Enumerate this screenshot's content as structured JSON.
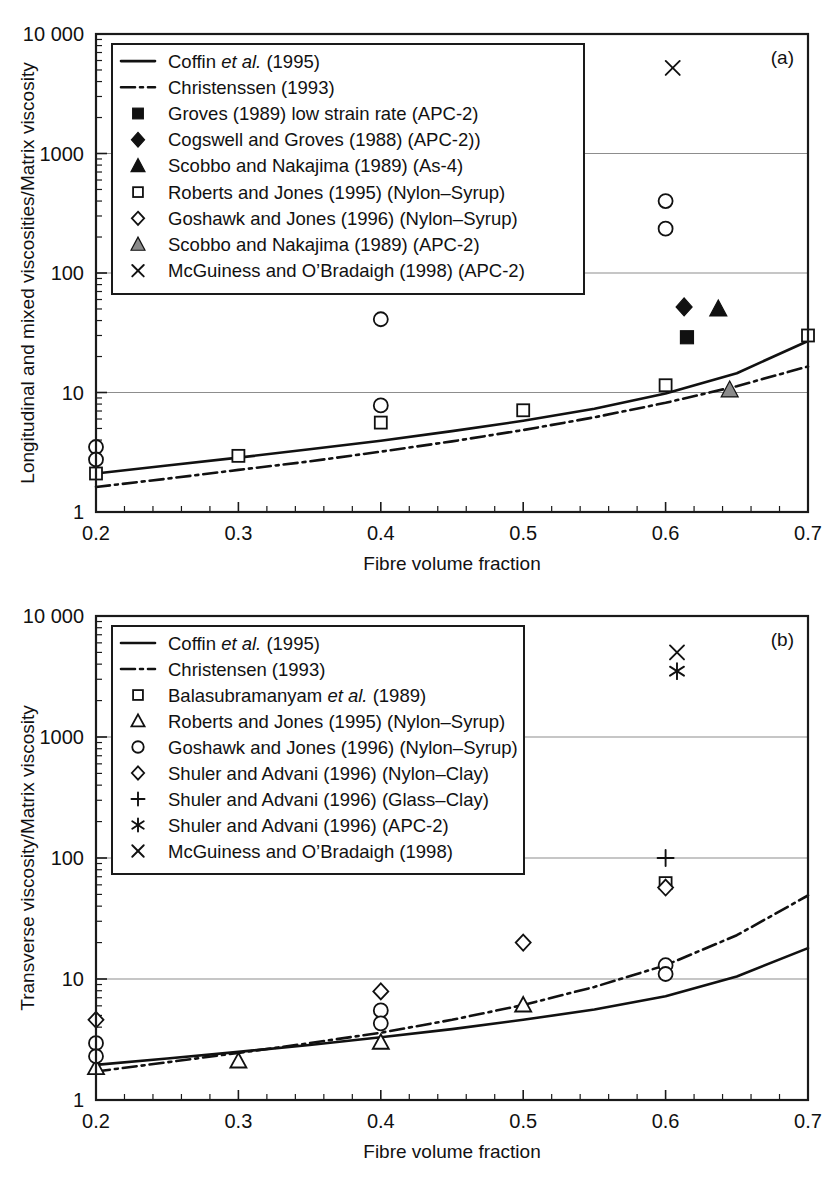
{
  "figure": {
    "panels": [
      "a",
      "b"
    ]
  },
  "panel_a": {
    "label": "(a)",
    "ylabel": "Longitudinal and mixed viscosities/Matrix viscosity",
    "xlabel": "Fibre volume fraction",
    "ytick_labels": [
      "1",
      "10",
      "100",
      "1000",
      "10 000"
    ],
    "xtick_labels": [
      "0.2",
      "0.3",
      "0.4",
      "0.5",
      "0.6",
      "0.7"
    ],
    "legend": [
      {
        "marker": "line-solid",
        "label": "Coffin ",
        "italic": "et al.",
        "tail": " (1995)"
      },
      {
        "marker": "line-dashdot",
        "label": "Christenssen (1993)",
        "italic": "",
        "tail": ""
      },
      {
        "marker": "square-filled",
        "label": "Groves (1989) low strain rate (APC-2)",
        "italic": "",
        "tail": ""
      },
      {
        "marker": "diamond-filled",
        "label": "Cogswell and Groves (1988) (APC-2))",
        "italic": "",
        "tail": ""
      },
      {
        "marker": "triangle-filled",
        "label": "Scobbo and Nakajima (1989) (As-4)",
        "italic": "",
        "tail": ""
      },
      {
        "marker": "square-open",
        "label": "Roberts and Jones (1995) (Nylon–Syrup)",
        "italic": "",
        "tail": ""
      },
      {
        "marker": "diamond-open",
        "label": "Goshawk and Jones (1996) (Nylon–Syrup)",
        "italic": "",
        "tail": ""
      },
      {
        "marker": "triangle-gray",
        "label": "Scobbo and Nakajima (1989) (APC-2)",
        "italic": "",
        "tail": ""
      },
      {
        "marker": "cross-x",
        "label": "McGuiness and O’Bradaigh (1998) (APC-2)",
        "italic": "",
        "tail": ""
      }
    ]
  },
  "panel_b": {
    "label": "(b)",
    "ylabel": "Transverse viscosity/Matrix viscosity",
    "xlabel": "Fibre volume fraction",
    "ytick_labels": [
      "1",
      "10",
      "100",
      "1000",
      "10 000"
    ],
    "xtick_labels": [
      "0.2",
      "0.3",
      "0.4",
      "0.5",
      "0.6",
      "0.7"
    ],
    "legend": [
      {
        "marker": "line-solid",
        "label": "Coffin ",
        "italic": "et al.",
        "tail": " (1995)"
      },
      {
        "marker": "line-dashdot",
        "label": "Christensen (1993)",
        "italic": "",
        "tail": ""
      },
      {
        "marker": "square-open",
        "label": "Balasubramanyam ",
        "italic": "et al.",
        "tail": " (1989)"
      },
      {
        "marker": "triangle-open",
        "label": "Roberts and Jones (1995) (Nylon–Syrup)",
        "italic": "",
        "tail": ""
      },
      {
        "marker": "circle-open",
        "label": "Goshawk and Jones (1996) (Nylon–Syrup)",
        "italic": "",
        "tail": ""
      },
      {
        "marker": "diamond-open",
        "label": "Shuler and Advani (1996) (Nylon–Clay)",
        "italic": "",
        "tail": ""
      },
      {
        "marker": "plus",
        "label": "Shuler and Advani (1996) (Glass–Clay)",
        "italic": "",
        "tail": ""
      },
      {
        "marker": "asterisk",
        "label": "Shuler and Advani (1996) (APC-2)",
        "italic": "",
        "tail": ""
      },
      {
        "marker": "cross-x",
        "label": "McGuiness and O’Bradaigh (1998)",
        "italic": "",
        "tail": ""
      }
    ]
  },
  "chart_data": [
    {
      "type": "scatter",
      "panel": "a",
      "title": "",
      "xlabel": "Fibre volume fraction",
      "ylabel": "Longitudinal and mixed viscosities/Matrix viscosity",
      "xlim": [
        0.2,
        0.7
      ],
      "ylim": [
        1,
        10000
      ],
      "yscale": "log",
      "xticks": [
        0.2,
        0.3,
        0.4,
        0.5,
        0.6,
        0.7
      ],
      "yticks": [
        1,
        10,
        100,
        1000,
        10000
      ],
      "grid": "horizontal-major",
      "legend_position": "upper-left",
      "series": [
        {
          "name": "Coffin et al. (1995)",
          "type": "line",
          "style": "solid",
          "x": [
            0.2,
            0.25,
            0.3,
            0.35,
            0.4,
            0.45,
            0.5,
            0.55,
            0.6,
            0.65,
            0.7
          ],
          "y": [
            2.1,
            2.45,
            2.85,
            3.35,
            3.95,
            4.75,
            5.8,
            7.3,
            9.8,
            14.5,
            27.0
          ]
        },
        {
          "name": "Christenssen (1993)",
          "type": "line",
          "style": "dashdot",
          "x": [
            0.2,
            0.25,
            0.3,
            0.35,
            0.4,
            0.45,
            0.5,
            0.55,
            0.6,
            0.65,
            0.7
          ],
          "y": [
            1.62,
            1.9,
            2.25,
            2.65,
            3.2,
            3.9,
            4.85,
            6.2,
            8.2,
            11.3,
            16.5
          ]
        },
        {
          "name": "Groves (1989) low strain rate (APC-2)",
          "type": "scatter",
          "marker": "square-filled",
          "x": [
            0.615
          ],
          "y": [
            29
          ]
        },
        {
          "name": "Cogswell and Groves (1988) (APC-2))",
          "type": "scatter",
          "marker": "diamond-filled",
          "x": [
            0.613
          ],
          "y": [
            52
          ]
        },
        {
          "name": "Scobbo and Nakajima (1989) (As-4)",
          "type": "scatter",
          "marker": "triangle-filled",
          "x": [
            0.637
          ],
          "y": [
            50
          ]
        },
        {
          "name": "Roberts and Jones (1995) (Nylon–Syrup)",
          "type": "scatter",
          "marker": "square-open",
          "x": [
            0.2,
            0.3,
            0.4,
            0.5,
            0.6,
            0.7
          ],
          "y": [
            2.1,
            2.95,
            5.6,
            7.1,
            11.5,
            30
          ]
        },
        {
          "name": "Goshawk and Jones (1996) (Nylon–Syrup)",
          "type": "scatter",
          "marker": "circle-open",
          "x": [
            0.2,
            0.2,
            0.4,
            0.4,
            0.6,
            0.6
          ],
          "y": [
            3.5,
            2.75,
            41,
            7.8,
            400,
            235
          ]
        },
        {
          "name": "Scobbo and Nakajima (1989) (APC-2)",
          "type": "scatter",
          "marker": "triangle-gray",
          "x": [
            0.645
          ],
          "y": [
            10.5
          ]
        },
        {
          "name": "McGuiness and O’Bradaigh (1998) (APC-2)",
          "type": "scatter",
          "marker": "cross-x",
          "x": [
            0.605
          ],
          "y": [
            5200
          ]
        }
      ]
    },
    {
      "type": "scatter",
      "panel": "b",
      "title": "",
      "xlabel": "Fibre volume fraction",
      "ylabel": "Transverse viscosity/Matrix viscosity",
      "xlim": [
        0.2,
        0.7
      ],
      "ylim": [
        1,
        10000
      ],
      "yscale": "log",
      "xticks": [
        0.2,
        0.3,
        0.4,
        0.5,
        0.6,
        0.7
      ],
      "yticks": [
        1,
        10,
        100,
        1000,
        10000
      ],
      "grid": "horizontal-major",
      "legend_position": "upper-left",
      "series": [
        {
          "name": "Coffin et al. (1995)",
          "type": "line",
          "style": "solid",
          "x": [
            0.2,
            0.25,
            0.3,
            0.35,
            0.4,
            0.45,
            0.5,
            0.55,
            0.6,
            0.65,
            0.7
          ],
          "y": [
            1.95,
            2.2,
            2.5,
            2.85,
            3.3,
            3.85,
            4.6,
            5.6,
            7.2,
            10.5,
            18.0
          ]
        },
        {
          "name": "Christensen (1993)",
          "type": "line",
          "style": "dashdot",
          "x": [
            0.2,
            0.25,
            0.3,
            0.35,
            0.4,
            0.45,
            0.5,
            0.55,
            0.6,
            0.65,
            0.7
          ],
          "y": [
            1.72,
            2.05,
            2.45,
            2.95,
            3.6,
            4.6,
            6.1,
            8.6,
            13.0,
            23.0,
            49.0
          ]
        },
        {
          "name": "Balasubramanyam et al. (1989)",
          "type": "scatter",
          "marker": "square-open",
          "x": [
            0.6
          ],
          "y": [
            62
          ]
        },
        {
          "name": "Roberts and Jones (1995) (Nylon–Syrup)",
          "type": "scatter",
          "marker": "triangle-open",
          "x": [
            0.2,
            0.3,
            0.4,
            0.5
          ],
          "y": [
            1.85,
            2.1,
            3.0,
            6.1
          ]
        },
        {
          "name": "Goshawk and Jones (1996) (Nylon–Syrup)",
          "type": "scatter",
          "marker": "circle-open",
          "x": [
            0.2,
            0.2,
            0.4,
            0.4,
            0.6,
            0.6
          ],
          "y": [
            2.95,
            2.3,
            5.5,
            4.3,
            13.0,
            11.0
          ]
        },
        {
          "name": "Shuler and Advani (1996) (Nylon–Clay)",
          "type": "scatter",
          "marker": "diamond-open",
          "x": [
            0.2,
            0.4,
            0.5,
            0.6
          ],
          "y": [
            4.6,
            7.9,
            20.0,
            57
          ]
        },
        {
          "name": "Shuler and Advani (1996) (Glass–Clay)",
          "type": "scatter",
          "marker": "plus",
          "x": [
            0.6
          ],
          "y": [
            100
          ]
        },
        {
          "name": "Shuler and Advani (1996) (APC-2)",
          "type": "scatter",
          "marker": "asterisk",
          "x": [
            0.608
          ],
          "y": [
            3500
          ]
        },
        {
          "name": "McGuiness and O’Bradaigh (1998)",
          "type": "scatter",
          "marker": "cross-x",
          "x": [
            0.608
          ],
          "y": [
            5000
          ]
        }
      ]
    }
  ]
}
